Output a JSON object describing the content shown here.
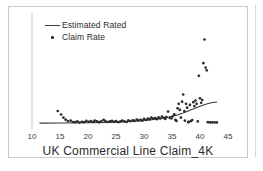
{
  "figure": {
    "title": "UK Commercial Line Claim_4K",
    "background_color": "#ffffff",
    "frame_color": "#c9c9c9",
    "ink_color": "#2b2b2b"
  },
  "legend": {
    "position": "top-left",
    "entries": [
      {
        "label": "Estimated Rated",
        "marker": "line",
        "color": "#3a3a3a"
      },
      {
        "label": "Claim Rate",
        "marker": "dot",
        "color": "#2b2b2b"
      }
    ]
  },
  "axis": {
    "x_ticks": [
      "10",
      "15",
      "20",
      "25",
      "30",
      "35",
      "40",
      "45"
    ]
  },
  "chart_data": {
    "type": "scatter",
    "title": "UK Commercial Line Claim_4K",
    "xlabel": "UK Commercial Line Claim_4K",
    "ylabel": "",
    "xlim": [
      10,
      45
    ],
    "ylim": [
      0,
      1
    ],
    "grid": false,
    "legend_position": "top-left",
    "series": [
      {
        "name": "Claim Rate",
        "type": "scatter",
        "color": "#2b2b2b",
        "marker": "dot",
        "points": [
          [
            14.6,
            0.15
          ],
          [
            15.2,
            0.118
          ],
          [
            15.6,
            0.09
          ],
          [
            16.0,
            0.072
          ],
          [
            16.4,
            0.058
          ],
          [
            16.9,
            0.062
          ],
          [
            17.3,
            0.05
          ],
          [
            17.7,
            0.048
          ],
          [
            18.1,
            0.055
          ],
          [
            18.5,
            0.045
          ],
          [
            18.9,
            0.052
          ],
          [
            19.3,
            0.048
          ],
          [
            19.7,
            0.06
          ],
          [
            20.1,
            0.052
          ],
          [
            20.5,
            0.058
          ],
          [
            20.9,
            0.05
          ],
          [
            21.2,
            0.063
          ],
          [
            21.6,
            0.055
          ],
          [
            22.0,
            0.048
          ],
          [
            22.4,
            0.058
          ],
          [
            22.8,
            0.07
          ],
          [
            23.1,
            0.058
          ],
          [
            23.5,
            0.05
          ],
          [
            23.9,
            0.055
          ],
          [
            24.3,
            0.06
          ],
          [
            24.7,
            0.052
          ],
          [
            25.0,
            0.058
          ],
          [
            25.4,
            0.048
          ],
          [
            25.8,
            0.055
          ],
          [
            26.1,
            0.062
          ],
          [
            26.5,
            0.056
          ],
          [
            26.9,
            0.05
          ],
          [
            27.2,
            0.064
          ],
          [
            27.6,
            0.058
          ],
          [
            28.0,
            0.066
          ],
          [
            28.3,
            0.06
          ],
          [
            28.7,
            0.072
          ],
          [
            29.0,
            0.064
          ],
          [
            29.4,
            0.07
          ],
          [
            29.7,
            0.062
          ],
          [
            30.0,
            0.078
          ],
          [
            30.4,
            0.07
          ],
          [
            30.7,
            0.082
          ],
          [
            31.0,
            0.074
          ],
          [
            31.3,
            0.09
          ],
          [
            31.6,
            0.08
          ],
          [
            32.0,
            0.086
          ],
          [
            32.3,
            0.076
          ],
          [
            32.6,
            0.092
          ],
          [
            32.9,
            0.082
          ],
          [
            33.2,
            0.1
          ],
          [
            33.5,
            0.088
          ],
          [
            33.8,
            0.078
          ],
          [
            34.0,
            0.095
          ],
          [
            34.3,
            0.145
          ],
          [
            34.6,
            0.088
          ],
          [
            34.9,
            0.082
          ],
          [
            35.1,
            0.1
          ],
          [
            35.4,
            0.12
          ],
          [
            35.6,
            0.07
          ],
          [
            35.8,
            0.06
          ],
          [
            36.0,
            0.175
          ],
          [
            36.2,
            0.215
          ],
          [
            36.4,
            0.16
          ],
          [
            36.6,
            0.09
          ],
          [
            36.8,
            0.235
          ],
          [
            37.0,
            0.3
          ],
          [
            37.2,
            0.15
          ],
          [
            37.3,
            0.062
          ],
          [
            37.5,
            0.215
          ],
          [
            37.7,
            0.18
          ],
          [
            37.9,
            0.048
          ],
          [
            38.0,
            0.052
          ],
          [
            38.2,
            0.205
          ],
          [
            38.4,
            0.058
          ],
          [
            38.6,
            0.068
          ],
          [
            38.8,
            0.23
          ],
          [
            39.0,
            0.195
          ],
          [
            39.2,
            0.245
          ],
          [
            39.4,
            0.215
          ],
          [
            39.6,
            0.055
          ],
          [
            39.8,
            0.47
          ],
          [
            40.0,
            0.265
          ],
          [
            40.2,
            0.225
          ],
          [
            40.4,
            0.25
          ],
          [
            40.6,
            0.585
          ],
          [
            40.8,
            0.8
          ],
          [
            41.0,
            0.545
          ],
          [
            41.2,
            0.52
          ],
          [
            41.4,
            0.048
          ],
          [
            41.8,
            0.046
          ],
          [
            42.2,
            0.046
          ],
          [
            42.6,
            0.046
          ],
          [
            43.0,
            0.046
          ]
        ]
      },
      {
        "name": "Estimated Rated",
        "type": "line",
        "color": "#3a3a3a",
        "points": [
          [
            11.4,
            0.04
          ],
          [
            15.0,
            0.041
          ],
          [
            20.0,
            0.043
          ],
          [
            24.0,
            0.047
          ],
          [
            27.0,
            0.053
          ],
          [
            29.0,
            0.059
          ],
          [
            31.0,
            0.068
          ],
          [
            33.0,
            0.082
          ],
          [
            34.5,
            0.096
          ],
          [
            36.0,
            0.115
          ],
          [
            37.0,
            0.132
          ],
          [
            38.0,
            0.152
          ],
          [
            39.0,
            0.173
          ],
          [
            40.0,
            0.194
          ],
          [
            41.0,
            0.212
          ],
          [
            42.0,
            0.225
          ],
          [
            43.0,
            0.232
          ]
        ]
      }
    ]
  }
}
